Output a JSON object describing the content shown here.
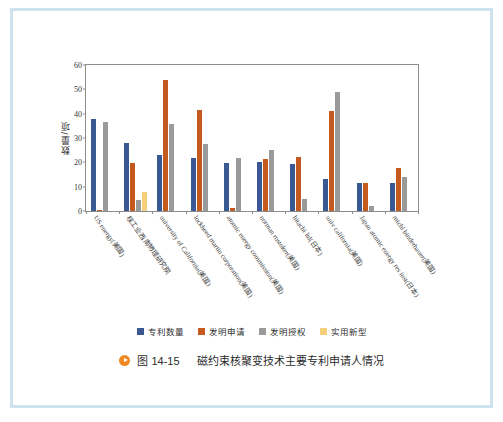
{
  "figure": {
    "caption_bullet": "play-bullet",
    "caption_number": "图 14-15",
    "caption_title": "磁约束核聚变技术主要专利申请人情况"
  },
  "chart_data": {
    "type": "bar",
    "title": "",
    "xlabel": "",
    "ylabel": "数量/项",
    "ylim": [
      0,
      60
    ],
    "yticks": [
      0,
      10,
      20,
      30,
      40,
      50,
      60
    ],
    "grid": false,
    "legend_position": "bottom",
    "categories": [
      "US energy(美国)",
      "核工业西南物理研究院",
      "university of California(美国)",
      "lockheed martin corporation(美国)",
      "atomic energy commission(美国)",
      "norman rostoker(美国)",
      "hitachi ltd(日本)",
      "univ california(美国)",
      "Japan atomic energy res inst(日本)",
      "michl binderbauer(美国)"
    ],
    "series": [
      {
        "name": "专利数量",
        "color": "#3a5894",
        "values": [
          38,
          28,
          23,
          21.8,
          19.7,
          20.2,
          19.5,
          13,
          11.5,
          11.5
        ]
      },
      {
        "name": "发明申请",
        "color": "#c55a1e",
        "values": [
          0.6,
          19.8,
          54,
          41.7,
          1.2,
          21.5,
          22,
          41,
          11.5,
          17.5
        ]
      },
      {
        "name": "发明授权",
        "color": "#9a9a9a",
        "values": [
          36.6,
          4.5,
          35.8,
          27.6,
          21.7,
          25,
          5,
          49,
          2,
          14
        ]
      },
      {
        "name": "实用新型",
        "color": "#f5d07a",
        "values": [
          0,
          7.8,
          0,
          0,
          0,
          0,
          0,
          0,
          0,
          0
        ]
      }
    ]
  }
}
